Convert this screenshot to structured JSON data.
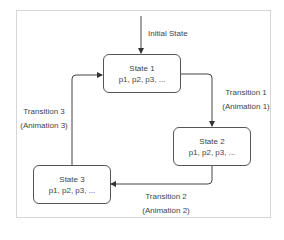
{
  "diagram": {
    "type": "state-machine",
    "initial_label": "Initial State",
    "states": [
      {
        "id": "s1",
        "title": "State 1",
        "params": "p1, p2, p3, ..."
      },
      {
        "id": "s2",
        "title": "State 2",
        "params": "p1, p2, p3, ..."
      },
      {
        "id": "s3",
        "title": "State 3",
        "params": "p1, p2, p3, ..."
      }
    ],
    "transitions": [
      {
        "from": "s1",
        "to": "s2",
        "name": "Transition 1",
        "animation": "(Animation 1)"
      },
      {
        "from": "s2",
        "to": "s3",
        "name": "Transition 2",
        "animation": "(Animation 2)"
      },
      {
        "from": "s3",
        "to": "s1",
        "name": "Transition 3",
        "animation": "(Animation 3)"
      }
    ],
    "colors": {
      "stroke": "#444444",
      "text": "#444444",
      "frame": "#d6d6d6"
    }
  }
}
